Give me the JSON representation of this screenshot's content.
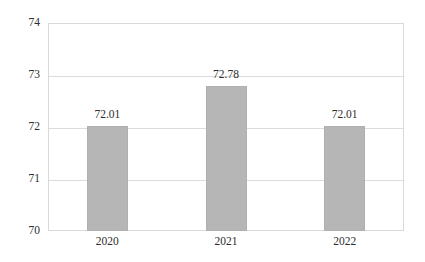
{
  "chart_data": {
    "type": "bar",
    "title": "",
    "subtitle": "",
    "xlabel": "",
    "ylabel": "",
    "categories": [
      "2020",
      "2021",
      "2022"
    ],
    "values": [
      72.01,
      72.78,
      72.01
    ],
    "data_labels": [
      "72.01",
      "72.78",
      "72.01"
    ],
    "ylim": [
      70,
      74
    ],
    "yticks": [
      70,
      71,
      72,
      73,
      74
    ],
    "ytick_labels": [
      "70",
      "71",
      "72",
      "73",
      "74"
    ],
    "grid": true,
    "legend": false,
    "legend_position": "none",
    "series": [
      {
        "name": "",
        "values": [
          72.01,
          72.78,
          72.01
        ],
        "color": "#b6b6b6"
      }
    ]
  },
  "style": {
    "bar_color": "#b6b6b6",
    "bar_border_color": "#b0b0b0",
    "gridline_color": "#dcdcdc",
    "plot_border_color": "#d9d9d9",
    "text_color": "#2d2d2d",
    "background": "#ffffff"
  }
}
